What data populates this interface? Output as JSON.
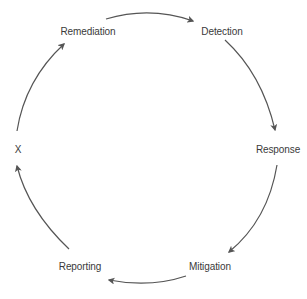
{
  "diagram": {
    "type": "cycle",
    "colors": {
      "background": "#ffffff",
      "arrow": "#555555",
      "text": "#3a3a3a"
    },
    "nodes": [
      {
        "id": "remediation",
        "label": "Remediation"
      },
      {
        "id": "detection",
        "label": "Detection"
      },
      {
        "id": "response",
        "label": "Response"
      },
      {
        "id": "mitigation",
        "label": "Mitigation"
      },
      {
        "id": "reporting",
        "label": "Reporting"
      },
      {
        "id": "x",
        "label": "X"
      }
    ],
    "edges": [
      {
        "from": "remediation",
        "to": "detection"
      },
      {
        "from": "detection",
        "to": "response"
      },
      {
        "from": "response",
        "to": "mitigation"
      },
      {
        "from": "mitigation",
        "to": "reporting"
      },
      {
        "from": "reporting",
        "to": "x"
      },
      {
        "from": "x",
        "to": "remediation"
      }
    ]
  }
}
